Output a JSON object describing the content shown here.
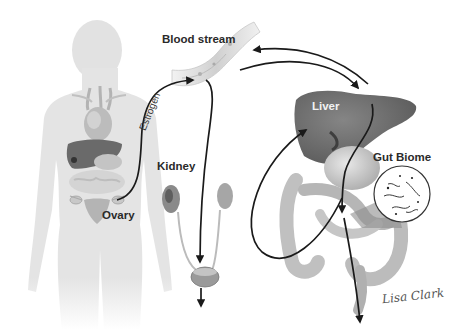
{
  "diagram": {
    "type": "estrogen-metabolism-pathway",
    "labels": {
      "blood_stream": "Blood stream",
      "estrogen": "Estrogen",
      "kidney": "Kidney",
      "ovary": "Ovary",
      "liver": "Liver",
      "gut_biome": "Gut Biome"
    },
    "signature": "Lisa Clark",
    "colors": {
      "arrow": "#1a1a1a",
      "body_silhouette": "#e3e3e3",
      "liver": "#6e6e6e",
      "organs": "#b8b8b8",
      "background": "#ffffff"
    },
    "flows": [
      {
        "from": "Ovary",
        "to": "Blood stream",
        "label": "Estrogen"
      },
      {
        "from": "Blood stream",
        "to": "Kidney / Bladder",
        "label": ""
      },
      {
        "from": "Blood stream",
        "to": "Liver",
        "label": ""
      },
      {
        "from": "Liver",
        "to": "Blood stream",
        "label": ""
      },
      {
        "from": "Liver",
        "to": "Gut",
        "label": ""
      },
      {
        "from": "Gut",
        "to": "Liver",
        "label": ""
      },
      {
        "from": "Gut",
        "to": "Excretion",
        "label": ""
      },
      {
        "from": "Bladder",
        "to": "Excretion",
        "label": ""
      }
    ]
  }
}
